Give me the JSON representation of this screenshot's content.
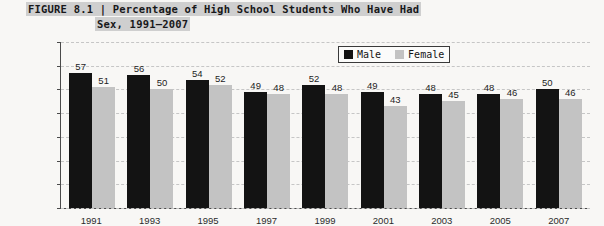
{
  "figure": {
    "title_line1": "FIGURE 8.1 | Percentage of High School Students Who Have Had",
    "title_line2": "Sex, 1991–2007"
  },
  "legend": {
    "male_label": "Male",
    "female_label": "Female",
    "male_color": "#131313",
    "female_color": "#c3c3c3"
  },
  "chart_data": {
    "type": "bar",
    "title": "FIGURE 8.1 | Percentage of High School Students Who Have Had Sex, 1991–2007",
    "xlabel": "",
    "ylabel": "",
    "ylim": [
      0,
      70
    ],
    "ytick_labels": [
      "0%",
      "10%",
      "20%",
      "30%",
      "40%",
      "50%",
      "60%",
      "70%"
    ],
    "ytick_values": [
      0,
      10,
      20,
      30,
      40,
      50,
      60,
      70
    ],
    "grid": true,
    "legend_position": "top-right",
    "categories": [
      "1991",
      "1993",
      "1995",
      "1997",
      "1999",
      "2001",
      "2003",
      "2005",
      "2007"
    ],
    "series": [
      {
        "name": "Male",
        "color": "#131313",
        "values": [
          57,
          56,
          54,
          49,
          52,
          49,
          48,
          48,
          50
        ]
      },
      {
        "name": "Female",
        "color": "#c3c3c3",
        "values": [
          51,
          50,
          52,
          48,
          48,
          43,
          45,
          46,
          46
        ]
      }
    ]
  }
}
